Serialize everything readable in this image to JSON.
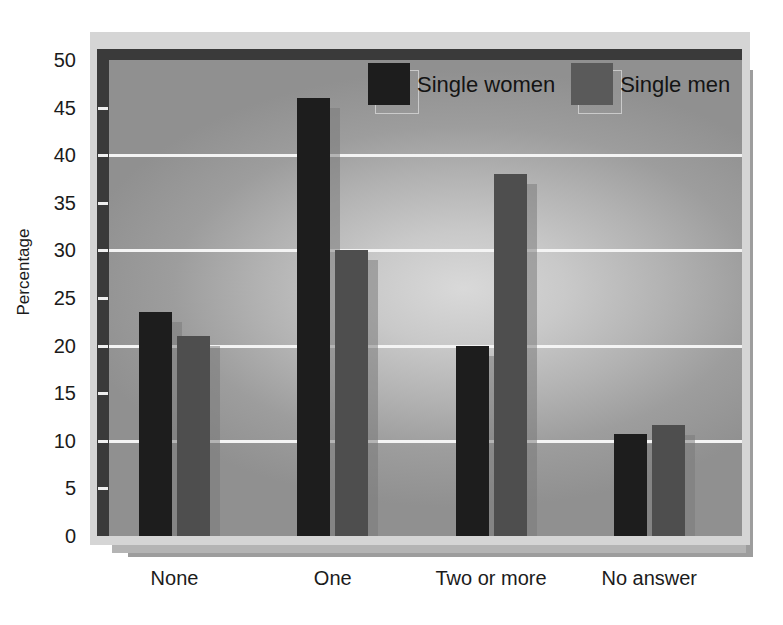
{
  "chart_data": {
    "type": "bar",
    "title": "",
    "subtitle": "",
    "xlabel": "",
    "ylabel": "Percentage",
    "ylim": [
      0,
      50
    ],
    "ytick_step": 5,
    "yticks": [
      50,
      45,
      40,
      35,
      30,
      25,
      20,
      15,
      10,
      5,
      0
    ],
    "gridlines": [
      40,
      30,
      20,
      10
    ],
    "grid": true,
    "categories": [
      "None",
      "One",
      "Two or more",
      "No answer"
    ],
    "series": [
      {
        "name": "Single women",
        "color": "#1d1d1d",
        "values": [
          23.5,
          46,
          20,
          10.7
        ]
      },
      {
        "name": "Single men",
        "color": "#4e4e4e",
        "values": [
          21,
          30,
          38,
          11.7
        ]
      }
    ],
    "legend_position": "top-center",
    "legend_entries": [
      "Single women",
      "Single men"
    ]
  },
  "axis": {
    "y_title": "Percentage",
    "y_labels": [
      "50",
      "45",
      "40",
      "35",
      "30",
      "25",
      "20",
      "15",
      "10",
      "5",
      "0"
    ],
    "x_labels": [
      "None",
      "One",
      "Two or more",
      "No answer"
    ]
  },
  "legend": {
    "items": [
      {
        "label": "Single women",
        "swatch": "legend-swatch-dark"
      },
      {
        "label": "Single men",
        "swatch": "legend-swatch-gray"
      }
    ]
  },
  "colors": {
    "women_bar": "#1d1d1d",
    "men_bar": "#4e4e4e",
    "gridline": "#f4f4f4",
    "axis_bar": "#3a3a3a",
    "frame": "#d5d5d5",
    "shadow_near": "#b4b4b4",
    "shadow_far": "#9d9d9d"
  }
}
